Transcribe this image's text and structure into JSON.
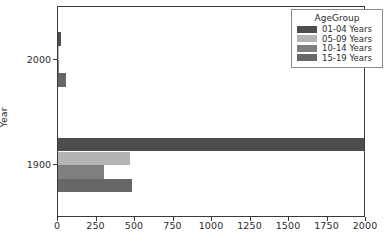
{
  "chart_data": {
    "type": "bar",
    "orientation": "horizontal",
    "grouped": true,
    "title": "",
    "xlabel": "",
    "ylabel": "Year",
    "categories": [
      "2000",
      "1900"
    ],
    "xlim": [
      0,
      2000
    ],
    "xticks": [
      0,
      250,
      500,
      750,
      1000,
      1250,
      1500,
      1750,
      2000
    ],
    "xtick_labels": [
      "0",
      "250",
      "500",
      "750",
      "1000",
      "1250",
      "1500",
      "1750",
      "2000"
    ],
    "ytick_labels": [
      "2000",
      "1900"
    ],
    "grid": false,
    "legend_position": "upper right",
    "legend_title": "AgeGroup",
    "series": [
      {
        "name": "01-04 Years",
        "color": "#4d4d4d",
        "values": [
          20,
          1985
        ]
      },
      {
        "name": "05-09 Years",
        "color": "#b4b4b4",
        "values": [
          2,
          465
        ]
      },
      {
        "name": "10-14 Years",
        "color": "#7f7f7f",
        "values": [
          2,
          300
        ]
      },
      {
        "name": "15-19 Years",
        "color": "#676767",
        "values": [
          55,
          480
        ]
      }
    ]
  },
  "legend": {
    "title": "AgeGroup",
    "entries": [
      {
        "label": "01-04 Years",
        "color": "#4d4d4d"
      },
      {
        "label": "05-09 Years",
        "color": "#b4b4b4"
      },
      {
        "label": "10-14 Years",
        "color": "#7f7f7f"
      },
      {
        "label": "15-19 Years",
        "color": "#676767"
      }
    ]
  },
  "axes": {
    "ylabel": "Year",
    "xticks": [
      "0",
      "250",
      "500",
      "750",
      "1000",
      "1250",
      "1500",
      "1750",
      "2000"
    ],
    "yticks": [
      "2000",
      "1900"
    ]
  }
}
